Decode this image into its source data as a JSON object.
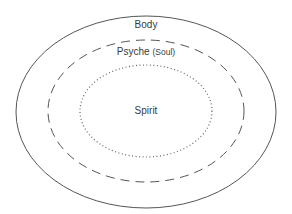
{
  "diagram": {
    "layers": [
      {
        "name": "Body",
        "style": "solid"
      },
      {
        "name": "Psyche",
        "subtitle": "(Soul)",
        "style": "dashed"
      },
      {
        "name": "Spirit",
        "style": "dotted"
      }
    ],
    "colors": {
      "stroke": "#555555",
      "text": "#3a3a3a",
      "background": "#ffffff"
    }
  }
}
